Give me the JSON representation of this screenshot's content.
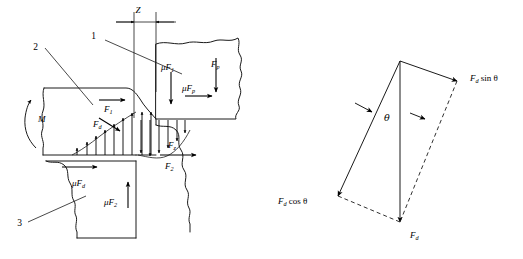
{
  "figure": {
    "background_color": "#ffffff",
    "line_color": "#1a1a1a"
  },
  "left_diagram": {
    "name": "cutting-force-diagram",
    "callouts": [
      {
        "id": "1",
        "label": "1"
      },
      {
        "id": "2",
        "label": "2"
      },
      {
        "id": "3",
        "label": "3"
      }
    ],
    "dimension": {
      "label": "Z"
    },
    "moment": {
      "label": "M"
    },
    "force_labels": [
      {
        "id": "mu-f1",
        "base": "μF",
        "sub": "1"
      },
      {
        "id": "f-p-top",
        "base": "F",
        "sub": "p"
      },
      {
        "id": "mu-f-p",
        "base": "μF",
        "sub": "p"
      },
      {
        "id": "f1",
        "base": "F",
        "sub": "1"
      },
      {
        "id": "f-d",
        "base": "F",
        "sub": "d"
      },
      {
        "id": "f-z",
        "base": "F",
        "sub": "z"
      },
      {
        "id": "f2",
        "base": "F",
        "sub": "2"
      },
      {
        "id": "mu-f-d",
        "base": "μF",
        "sub": "d"
      },
      {
        "id": "mu-f2",
        "base": "μF",
        "sub": "2"
      }
    ]
  },
  "right_diagram": {
    "name": "force-resolution-parallelogram",
    "angle_label": "θ",
    "vectors": [
      {
        "id": "fd-sin-theta",
        "base": "F",
        "sub": "d",
        "suffix": " sin θ"
      },
      {
        "id": "fd-cos-theta",
        "base": "F",
        "sub": "d",
        "suffix": " cos θ"
      },
      {
        "id": "fd",
        "base": "F",
        "sub": "d",
        "suffix": ""
      }
    ]
  }
}
